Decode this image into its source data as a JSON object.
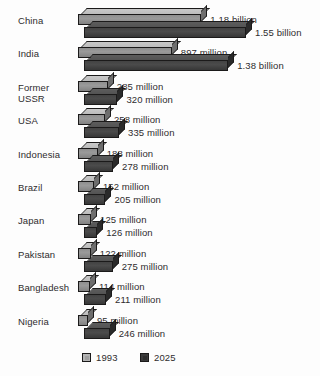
{
  "chart_data": {
    "type": "bar",
    "orientation": "horizontal",
    "title": "",
    "subtitle": "",
    "xlabel": "",
    "ylabel": "",
    "grid": false,
    "legend_position": "bottom",
    "units": "people",
    "categories": [
      "China",
      "India",
      "Former\nUSSR",
      "USA",
      "Indonesia",
      "Brazil",
      "Japan",
      "Pakistan",
      "Bangladesh",
      "Nigeria"
    ],
    "series": [
      {
        "name": "1993",
        "color": "#9a9a9a",
        "values": [
          1180000000,
          897000000,
          285000000,
          258000000,
          188000000,
          152000000,
          125000000,
          122000000,
          114000000,
          95000000
        ],
        "labels": [
          "1.18 billion",
          "897 million",
          "285 million",
          "258 million",
          "188 million",
          "152 million",
          "125 million",
          "122 million",
          "114 million",
          "95 million"
        ]
      },
      {
        "name": "2025",
        "color": "#434343",
        "values": [
          1550000000,
          1380000000,
          320000000,
          335000000,
          278000000,
          205000000,
          126000000,
          275000000,
          211000000,
          246000000
        ],
        "labels": [
          "1.55 billion",
          "1.38 billion",
          "320 million",
          "335 million",
          "278 million",
          "205 million",
          "126 million",
          "275 million",
          "211 million",
          "246 million"
        ]
      }
    ],
    "xlim": [
      0,
      1550000000
    ]
  },
  "legend": {
    "items": [
      {
        "label": "1993",
        "swatch": "light-gray-swatch"
      },
      {
        "label": "2025",
        "swatch": "dark-gray-swatch"
      }
    ]
  }
}
